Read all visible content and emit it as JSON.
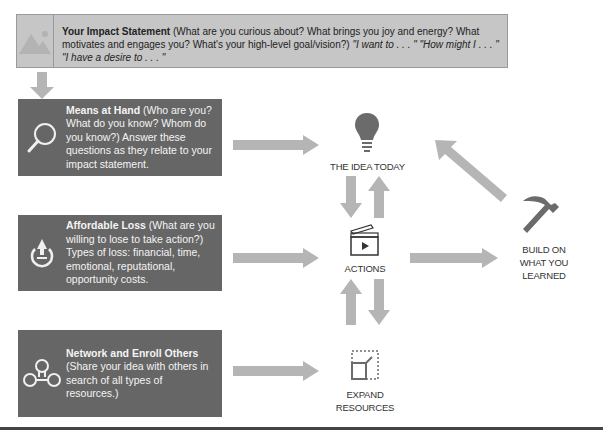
{
  "impact": {
    "icon": "image-placeholder-icon",
    "title": "Your Impact Statement",
    "body": " (What are you curious about? What brings you joy and energy? What motivates and engages you? What's your high-level goal/vision?) ",
    "prompts": "\"I want to . . . \" \"How might I . . . \" \"I have a desire to . . . \""
  },
  "left_boxes": [
    {
      "icon": "magnifier-icon",
      "title": "Means at Hand",
      "body": " (Who are you? What do you know? Whom do you know?) Answer these questions as they relate to your impact statement."
    },
    {
      "icon": "affordable-loss-icon",
      "title": "Affordable Loss",
      "body": " (What are you willing to lose to take action?) Types of loss: financial, time, emotional, reputational, opportunity costs."
    },
    {
      "icon": "network-icon",
      "title": "Network and Enroll Others",
      "body": " (Share your idea with others in search of all types of resources.)"
    }
  ],
  "nodes": {
    "idea": {
      "icon": "lightbulb-icon",
      "label": "THE IDEA TODAY"
    },
    "actions": {
      "icon": "clapperboard-icon",
      "label": "ACTIONS"
    },
    "expand": {
      "icon": "expand-resources-icon",
      "label_line1": "EXPAND",
      "label_line2": "RESOURCES"
    },
    "build": {
      "icon": "hammer-icon",
      "label_line1": "BUILD ON",
      "label_line2": "WHAT YOU",
      "label_line3": "LEARNED"
    }
  },
  "colors": {
    "impact_bg": "#c6c6c6",
    "box_bg": "#666666",
    "arrow": "#b5b5b5",
    "icon_dark": "#6b6b6b"
  }
}
